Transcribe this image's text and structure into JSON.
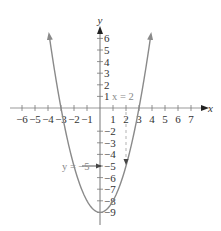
{
  "chart_data": {
    "type": "line",
    "title": "",
    "function": "y = x^2 - 9",
    "xlabel": "x",
    "ylabel": "y",
    "xlim": [
      -7,
      7.5
    ],
    "ylim": [
      -10,
      7
    ],
    "grid": false,
    "x_ticks": [
      -6,
      -5,
      -4,
      -3,
      -2,
      -1,
      1,
      2,
      3,
      4,
      5,
      6,
      7
    ],
    "x_tick_labels": [
      "−6",
      "−5",
      "−4",
      "−3",
      "−2",
      "−1",
      "1",
      "2",
      "3",
      "4",
      "5",
      "6",
      "7"
    ],
    "y_ticks": [
      6,
      5,
      4,
      3,
      2,
      1,
      -2,
      -3,
      -4,
      -5,
      -6,
      -7,
      -8,
      -9
    ],
    "y_tick_labels": [
      "6",
      "5",
      "4",
      "3",
      "2",
      "1",
      "−2",
      "−3",
      "−4",
      "−5",
      "−6",
      "−7",
      "−8",
      "−9"
    ],
    "series": [
      {
        "name": "parabola",
        "x": [
          -3.9,
          -3,
          -2,
          -1,
          0,
          1,
          2,
          3,
          3.9
        ],
        "y": [
          6.2,
          0,
          -5,
          -8,
          -9,
          -8,
          -5,
          0,
          6.2
        ],
        "color": "#8a8a8a"
      }
    ],
    "vertex": [
      0,
      -9
    ],
    "x_intercepts": [
      -3,
      3
    ],
    "annotations": [
      {
        "text": "x = 2",
        "position": [
          2,
          1
        ],
        "style": "dashed vertical line from x-axis to curve at x = 2"
      },
      {
        "text": "y = −5",
        "position": [
          -1.7,
          -5
        ],
        "style": "arrow pointing to y-axis at −5"
      }
    ]
  },
  "labels": {
    "x_axis": "x",
    "y_axis": "y",
    "annotation_x": "x = 2",
    "annotation_y": "y = −5"
  }
}
